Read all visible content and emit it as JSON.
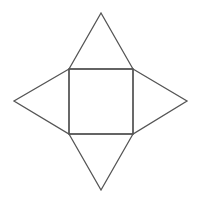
{
  "diagram": {
    "title": "",
    "stroke_color": "#555555",
    "background": "#ffffff",
    "square": {
      "x1": 69,
      "y1": 69,
      "x2": 133,
      "y2": 134
    },
    "triangles": [
      {
        "name": "top",
        "points": "69,69 101,13 133,69"
      },
      {
        "name": "right",
        "points": "133,69 187,101 133,134"
      },
      {
        "name": "bottom",
        "points": "69,134 101,190 133,134"
      },
      {
        "name": "left",
        "points": "69,69 14,101 69,134"
      }
    ]
  }
}
